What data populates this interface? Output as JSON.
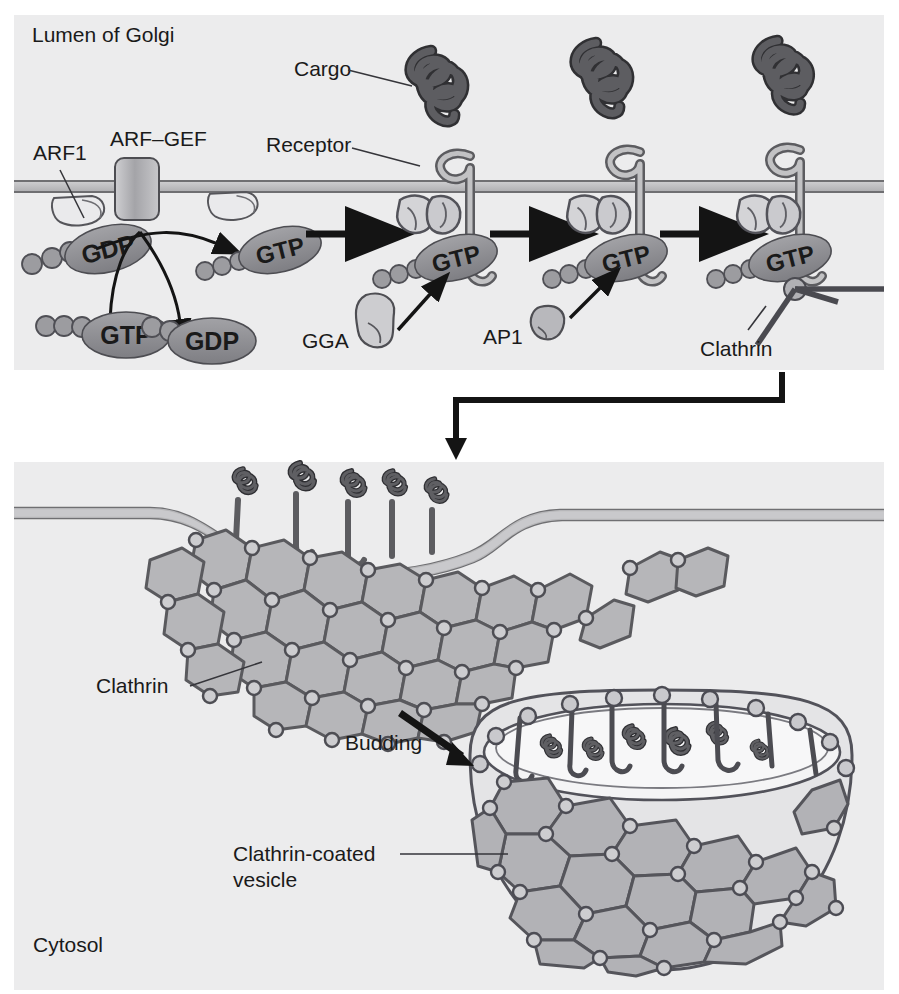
{
  "figure": {
    "title_visible": false,
    "panels": [
      {
        "id": "top-panel",
        "name": "arf1-recruitment-and-coat-assembly",
        "bounds": {
          "x": 14,
          "y": 15,
          "w": 870,
          "h": 355
        },
        "background_color": "#ececed"
      },
      {
        "id": "bottom-panel",
        "name": "clathrin-coated-pit-and-vesicle",
        "bounds": {
          "x": 14,
          "y": 462,
          "w": 870,
          "h": 528
        },
        "background_color": "#ececed"
      }
    ]
  },
  "colors": {
    "panel_bg": "#ececed",
    "page_bg": "#ffffff",
    "membrane_fill": "#b9b9bb",
    "membrane_line": "#6f6f72",
    "cargo_dark": "#58585c",
    "cargo_outline": "#303033",
    "receptor_fill": "#bcbcbe",
    "receptor_outline": "#5c5c60",
    "nucleotide_pill": "#8c8c90",
    "pill_text": "#ffffff",
    "arf1_fill": "#e8e8ea",
    "adaptor_fill": "#cfcfd2",
    "gef_fill": "#a9a9ad",
    "clathrin_line": "#5a5a5e",
    "coat_facet": "#b3b3b6",
    "arrow_black": "#141414",
    "label_text": "#1a1a1a",
    "leader_line": "#35353a"
  },
  "top_panel": {
    "compartment_label": "Lumen of Golgi",
    "labels": {
      "arf1": "ARF1",
      "arf_gef": "ARF–GEF",
      "cargo": "Cargo",
      "receptor": "Receptor",
      "gga": "GGA",
      "ap1": "AP1",
      "clathrin": "Clathrin"
    },
    "nucleotides": {
      "gdp": "GDP",
      "gtp": "GTP"
    },
    "cycle": {
      "membrane_bound_inactive": "GDP",
      "exchange_in": "GTP",
      "exchange_out": "GDP",
      "membrane_bound_active": "GTP"
    },
    "stages": [
      {
        "order": 1,
        "name": "arf1-gdp-at-membrane",
        "nucleotide": "GDP",
        "has_cargo": false,
        "has_receptor": false,
        "adaptor": null,
        "clathrin": false
      },
      {
        "order": 2,
        "name": "arf1-gtp-activated",
        "nucleotide": "GTP",
        "has_cargo": false,
        "has_receptor": false,
        "adaptor": null,
        "clathrin": false
      },
      {
        "order": 3,
        "name": "gga-recruitment",
        "nucleotide": "GTP",
        "has_cargo": true,
        "has_receptor": true,
        "adaptor": "GGA",
        "clathrin": false
      },
      {
        "order": 4,
        "name": "ap1-recruitment",
        "nucleotide": "GTP",
        "has_cargo": true,
        "has_receptor": true,
        "adaptor": "AP1",
        "clathrin": false
      },
      {
        "order": 5,
        "name": "clathrin-recruitment",
        "nucleotide": "GTP",
        "has_cargo": true,
        "has_receptor": true,
        "adaptor": "AP1",
        "clathrin": true
      }
    ],
    "arrow_count_between_stages": 3
  },
  "bottom_panel": {
    "compartment_label": "Cytosol",
    "labels": {
      "clathrin": "Clathrin",
      "budding": "Budding",
      "clathrin_coated_vesicle_line1": "Clathrin-coated",
      "clathrin_coated_vesicle_line2": "vesicle"
    },
    "pit": {
      "name": "clathrin-coated-pit",
      "cargo_molecules": 5,
      "lattice": "hexagonal"
    },
    "vesicle": {
      "name": "clathrin-coated-vesicle",
      "cargo_molecules": 6,
      "lattice": "hexagonal"
    }
  },
  "connector_arrow": {
    "name": "panel-transition-arrow",
    "direction": "down"
  }
}
